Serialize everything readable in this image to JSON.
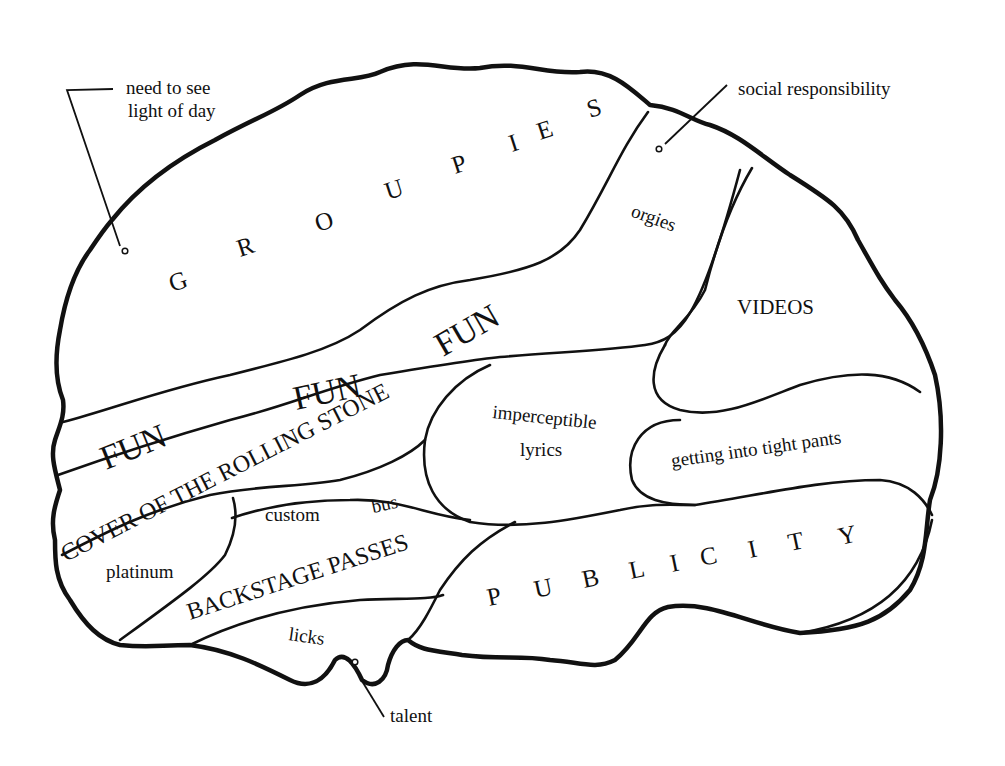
{
  "colors": {
    "ink": "#111111",
    "paper": "#ffffff"
  },
  "regions": {
    "groupies": [
      "G",
      "R",
      "O",
      "U",
      "P",
      "I",
      "E",
      "S"
    ],
    "orgies": "orgies",
    "videos": "VIDEOS",
    "fun": [
      "FUN",
      "FUN",
      "FUN"
    ],
    "cover": "COVER OF THE ROLLING STONE",
    "imperceptible_lyrics": [
      "imperceptible",
      "lyrics"
    ],
    "tight_pants": "getting into tight pants",
    "custom": "custom",
    "bus": "bus",
    "platinum": "platinum",
    "backstage": "BACKSTAGE PASSES",
    "licks": "licks",
    "publicity": [
      "P",
      "U",
      "B",
      "L",
      "I",
      "C",
      "I",
      "T",
      "Y"
    ]
  },
  "callouts": {
    "light_of_day": [
      "need to see",
      "light of day"
    ],
    "social_responsibility": "social responsibility",
    "talent": "talent"
  }
}
